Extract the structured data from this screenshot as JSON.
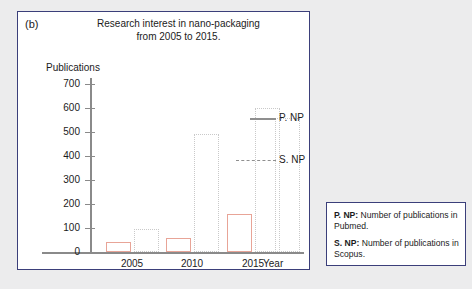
{
  "panel": {
    "label": "(b)",
    "title": "Research interest in nano-packaging\nfrom 2005 to 2015."
  },
  "chart_data": {
    "type": "bar",
    "xlabel": "Year",
    "ylabel": "Publications",
    "ylim": [
      0,
      700
    ],
    "ytick_labels": [
      "700",
      "600",
      "500",
      "400",
      "300",
      "200",
      "100",
      "0"
    ],
    "ytick_values": [
      700,
      600,
      500,
      400,
      300,
      200,
      100,
      0
    ],
    "categories": [
      "2005",
      "2010",
      "2015"
    ],
    "grid": false,
    "legend_position": "outside-bottom-right",
    "series": [
      {
        "name": "P. NP",
        "style": "solid-outline",
        "color": "#e8a497",
        "values": [
          40,
          60,
          160
        ]
      },
      {
        "name": "S. NP",
        "style": "dotted-outline",
        "color": "#c9c9c9",
        "values": [
          95,
          490,
          600
        ]
      },
      {
        "name": "S. NP (secondary)",
        "style": "dotted-outline",
        "color": "#c9c9c9",
        "values": [
          null,
          null,
          560
        ]
      }
    ],
    "annotations": [
      {
        "text": "P. NP",
        "leader": "solid"
      },
      {
        "text": "S. NP",
        "leader": "dashed"
      }
    ]
  },
  "legend": {
    "entries": [
      {
        "key": "P. NP:",
        "text": " Number of publications in Pubmed."
      },
      {
        "key": "S. NP:",
        "text": " Number of publications in Scopus."
      }
    ]
  }
}
